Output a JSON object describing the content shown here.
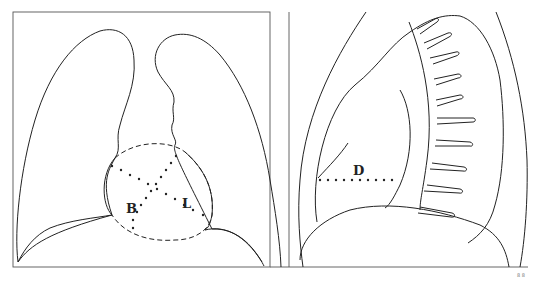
{
  "figure": {
    "panels": [
      {
        "id": "frontal",
        "view": "frontal chest outline with heart silhouette",
        "labels": [
          {
            "text": "B",
            "x": 131,
            "y": 210
          },
          {
            "text": "L",
            "x": 186,
            "y": 206
          }
        ]
      },
      {
        "id": "lateral",
        "view": "lateral chest outline with ribs",
        "labels": [
          {
            "text": "D",
            "x": 355,
            "y": 173
          }
        ]
      }
    ],
    "corner_mark": "8 8"
  },
  "colors": {
    "line": "#222222",
    "frame": "#555555",
    "background": "#ffffff"
  }
}
